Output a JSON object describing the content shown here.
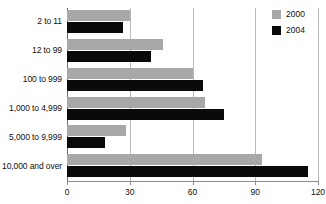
{
  "chart_data": {
    "type": "bar",
    "orientation": "horizontal",
    "title": "",
    "subtitle": "",
    "xlabel": "",
    "ylabel": "",
    "xlim": [
      0,
      120
    ],
    "xticks": [
      "0",
      "30",
      "60",
      "90",
      "120"
    ],
    "xtick_values": [
      0,
      30,
      60,
      90,
      120
    ],
    "grid": "vertical",
    "legend_position": "top-right",
    "categories": [
      "2 to 11",
      "12 to 99",
      "100 to 999",
      "1,000 to 4,999",
      "5,000 to 9,999",
      "10,000 and over"
    ],
    "series": [
      {
        "name": "2000",
        "color": "#a8a8a8",
        "values": [
          30,
          46,
          60,
          66,
          28,
          93
        ]
      },
      {
        "name": "2004",
        "color": "#0a0a0a",
        "values": [
          27,
          40,
          65,
          75,
          18,
          115
        ]
      }
    ]
  },
  "legend": {
    "items": [
      {
        "label": "2000",
        "color": "#a8a8a8"
      },
      {
        "label": "2004",
        "color": "#0a0a0a"
      }
    ]
  },
  "colors": {
    "series_2000": "#a8a8a8",
    "series_2004": "#0a0a0a",
    "gridline": "#b9b9b9",
    "axis": "#6e6e6e",
    "text": "#111111",
    "background": "#ffffff"
  }
}
